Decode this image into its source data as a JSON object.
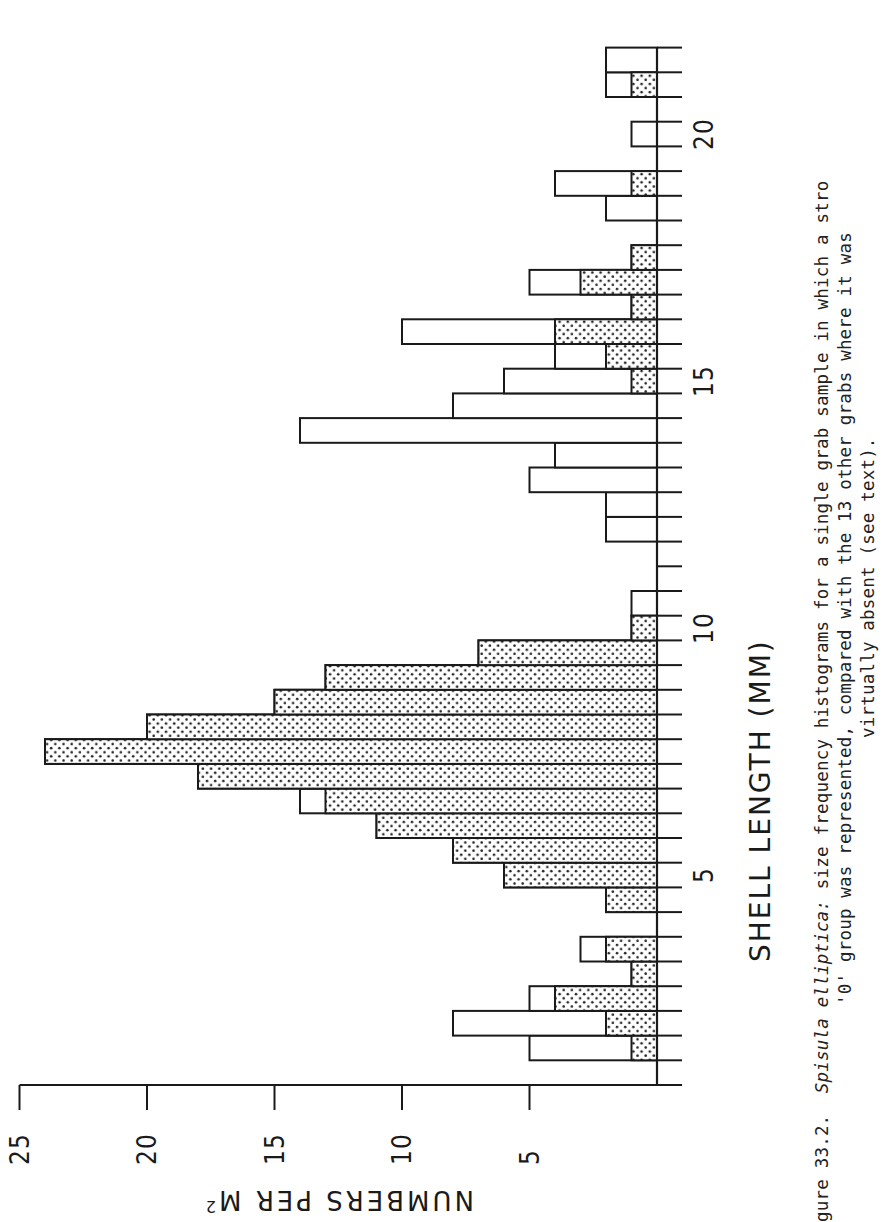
{
  "figure": {
    "label": "gure 33.2.",
    "caption_species": "Spisula elliptica:",
    "caption_line1_rest": " size frequency histograms for a single grab sample in which a stro",
    "caption_line2": "'0' group was represented, compared with the 13 other grabs where it was",
    "caption_line3": "virtually absent (see text)."
  },
  "axes": {
    "x_title": "SHELL LENGTH (MM)",
    "y_title_text": "NUMBERS PER M",
    "y_title_sup": "2",
    "y_ticks": [
      "25",
      "20",
      "15",
      "10",
      "5"
    ],
    "x_tick_labels": [
      "5",
      "10",
      "15",
      "20"
    ]
  },
  "chart_data": {
    "type": "bar",
    "orientation": "rotated 90° (length axis vertical, count axis horizontal)",
    "title": "Spisula elliptica: size frequency histograms",
    "xlabel": "SHELL LENGTH (MM)",
    "ylabel": "NUMBERS PER M²",
    "ylim": [
      0,
      25
    ],
    "y_ticks": [
      5,
      10,
      15,
      20,
      25
    ],
    "x_ticks_labeled": [
      5,
      10,
      15,
      20
    ],
    "bin_width_mm": 0.5,
    "grid": false,
    "legend": null,
    "categories": [
      1.0,
      1.5,
      2.0,
      2.5,
      3.0,
      3.5,
      4.0,
      4.5,
      5.0,
      5.5,
      6.0,
      6.5,
      7.0,
      7.5,
      8.0,
      8.5,
      9.0,
      9.5,
      10.0,
      10.5,
      11.0,
      11.5,
      12.0,
      12.5,
      13.0,
      13.5,
      14.0,
      14.5,
      15.0,
      15.5,
      16.0,
      16.5,
      17.0,
      17.5,
      18.0,
      18.5,
      19.0,
      19.5,
      20.0,
      20.5,
      21.0,
      21.5
    ],
    "series": [
      {
        "name": "Single grab sample (open bars)",
        "style": "open",
        "values": [
          0,
          5,
          8,
          5,
          1,
          3,
          0,
          2,
          6,
          8,
          11,
          14,
          18,
          24,
          20,
          15,
          13,
          7,
          1,
          1,
          0,
          0,
          2,
          2,
          5,
          4,
          14,
          8,
          6,
          4,
          10,
          1,
          5,
          1,
          0,
          2,
          4,
          0,
          1,
          0,
          2,
          2
        ]
      },
      {
        "name": "Other 13 grabs (stippled bars)",
        "style": "stippled",
        "values": [
          0,
          1,
          2,
          4,
          1,
          2,
          0,
          2,
          6,
          8,
          11,
          13,
          18,
          24,
          20,
          15,
          13,
          7,
          1,
          0,
          0,
          0,
          0,
          0,
          0,
          0,
          0,
          0,
          1,
          2,
          4,
          1,
          3,
          1,
          0,
          0,
          1,
          0,
          0,
          0,
          1,
          0
        ]
      }
    ]
  },
  "layout": {
    "baseline_x": 657,
    "axis_y": 1085,
    "px_per_unit": 25.5,
    "bin_px": 24.7,
    "ink_color": "#1a1a1a"
  }
}
